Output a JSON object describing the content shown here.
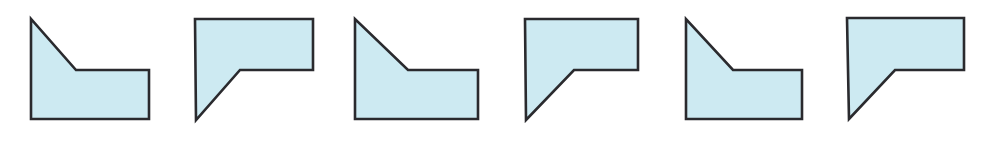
{
  "figure": {
    "background_color": "#ffffff",
    "width": 988,
    "height": 141
  },
  "style": {
    "fill_color": "#cdeaf2",
    "stroke_color": "#2a2a2e",
    "stroke_width": 2.6
  },
  "shapes": [
    {
      "name": "pentagon-tile-1",
      "orientation": "diagonal-top-left-descending",
      "label": "Shape 1",
      "box": {
        "x": 18,
        "y": 8,
        "width": 146,
        "height": 125
      },
      "points": "13,11 13,111 131,111 131,62 58,62",
      "view_box": "0 0 146 125"
    },
    {
      "name": "pentagon-tile-2",
      "orientation": "diagonal-bottom-left-ascending",
      "label": "Shape 2",
      "box": {
        "x": 183,
        "y": 8,
        "width": 146,
        "height": 125
      },
      "points": "12,11 130,11 130,62 57,62 13,112",
      "view_box": "0 0 146 125"
    },
    {
      "name": "pentagon-tile-3",
      "orientation": "diagonal-top-left-descending",
      "label": "Shape 3",
      "box": {
        "x": 342,
        "y": 8,
        "width": 146,
        "height": 125
      },
      "points": "13,11 13,111 136,111 136,62 66,62",
      "view_box": "0 0 146 125"
    },
    {
      "name": "pentagon-tile-4",
      "orientation": "diagonal-bottom-left-ascending",
      "label": "Shape 4",
      "box": {
        "x": 512,
        "y": 8,
        "width": 146,
        "height": 125
      },
      "points": "13,11 126,11 126,62 62,62 14,112",
      "view_box": "0 0 146 125"
    },
    {
      "name": "pentagon-tile-5",
      "orientation": "diagonal-top-left-descending",
      "label": "Shape 5",
      "box": {
        "x": 673,
        "y": 8,
        "width": 146,
        "height": 125
      },
      "points": "13,11 13,111 129,111 129,62 60,62",
      "view_box": "0 0 146 125"
    },
    {
      "name": "pentagon-tile-6",
      "orientation": "diagonal-bottom-left-ascending",
      "label": "Shape 6",
      "box": {
        "x": 834,
        "y": 8,
        "width": 146,
        "height": 125
      },
      "points": "13,10 130,10 130,62 61,62 15,111",
      "view_box": "0 0 146 125"
    }
  ]
}
